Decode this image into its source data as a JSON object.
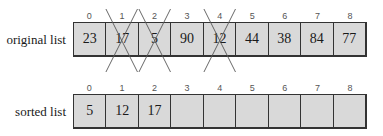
{
  "indices": [
    "0",
    "1",
    "2",
    "3",
    "4",
    "5",
    "6",
    "7",
    "8"
  ],
  "original": {
    "label": "original list",
    "cells": [
      {
        "value": "23",
        "crossed": false
      },
      {
        "value": "17",
        "crossed": true
      },
      {
        "value": "5",
        "crossed": true
      },
      {
        "value": "90",
        "crossed": false
      },
      {
        "value": "12",
        "crossed": true
      },
      {
        "value": "44",
        "crossed": false
      },
      {
        "value": "38",
        "crossed": false
      },
      {
        "value": "84",
        "crossed": false
      },
      {
        "value": "77",
        "crossed": false
      }
    ]
  },
  "sorted": {
    "label": "sorted list",
    "cells": [
      {
        "value": "5"
      },
      {
        "value": "12"
      },
      {
        "value": "17"
      },
      {
        "value": ""
      },
      {
        "value": ""
      },
      {
        "value": ""
      },
      {
        "value": ""
      },
      {
        "value": ""
      },
      {
        "value": ""
      }
    ]
  },
  "colors": {
    "cell_fill": "#d9d9d9",
    "border": "#333333"
  }
}
